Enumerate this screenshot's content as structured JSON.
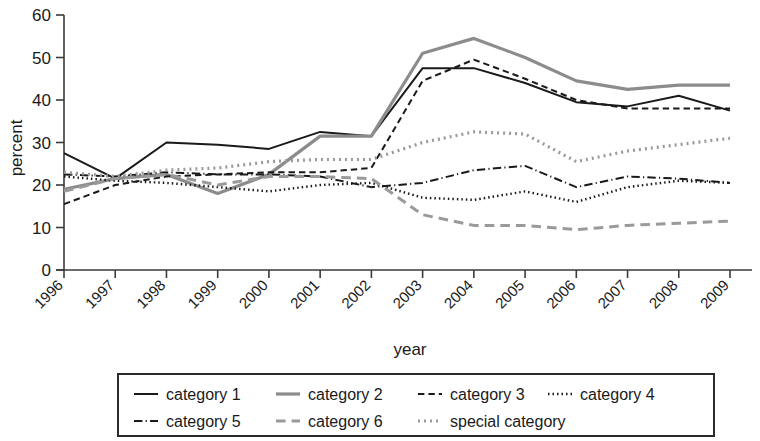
{
  "chart_data": {
    "type": "line",
    "title": "",
    "xlabel": "year",
    "ylabel": "percent",
    "xlim": [
      1996,
      2009
    ],
    "ylim": [
      0,
      60
    ],
    "yticks": [
      0,
      10,
      20,
      30,
      40,
      50,
      60
    ],
    "grid": false,
    "legend_position": "bottom",
    "categories": [
      1996,
      1997,
      1998,
      1999,
      2000,
      2001,
      2002,
      2003,
      2004,
      2005,
      2006,
      2007,
      2008,
      2009
    ],
    "tick_labels": [
      "1996",
      "1997",
      "1998",
      "1999",
      "2000",
      "2001",
      "2002",
      "2003",
      "2004",
      "2005",
      "2006",
      "2007",
      "2008",
      "2009"
    ],
    "series": [
      {
        "name": "category 1",
        "style": "solid",
        "color": "#1a1a1a",
        "width": 2.0,
        "values": [
          27.5,
          21.5,
          30.0,
          29.5,
          28.5,
          32.5,
          31.5,
          47.5,
          47.5,
          44.0,
          39.5,
          38.5,
          41.0,
          37.5
        ]
      },
      {
        "name": "category 2",
        "style": "solid",
        "color": "#8c8c8c",
        "width": 3.2,
        "values": [
          19.0,
          21.5,
          22.5,
          18.0,
          22.5,
          31.5,
          31.5,
          51.0,
          54.5,
          50.0,
          44.5,
          42.5,
          43.5,
          43.5
        ]
      },
      {
        "name": "category 3",
        "style": "dashed",
        "color": "#1a1a1a",
        "width": 2.0,
        "values": [
          15.5,
          20.0,
          22.0,
          22.5,
          23.0,
          23.0,
          24.0,
          44.5,
          49.5,
          45.0,
          40.0,
          38.0,
          38.0,
          38.0
        ]
      },
      {
        "name": "category 4",
        "style": "dotted",
        "color": "#1a1a1a",
        "width": 2.4,
        "values": [
          22.0,
          21.0,
          20.5,
          19.5,
          18.5,
          20.0,
          20.5,
          17.0,
          16.5,
          18.5,
          16.0,
          19.5,
          21.0,
          20.5
        ]
      },
      {
        "name": "category 5",
        "style": "dashdot",
        "color": "#1a1a1a",
        "width": 2.0,
        "values": [
          22.5,
          22.0,
          23.0,
          22.5,
          22.5,
          22.0,
          19.5,
          20.5,
          23.5,
          24.5,
          19.5,
          22.0,
          21.5,
          20.5
        ]
      },
      {
        "name": "category 6",
        "style": "dashed",
        "color": "#9a9a9a",
        "width": 3.0,
        "values": [
          18.5,
          21.5,
          22.5,
          20.0,
          22.0,
          22.0,
          21.5,
          13.0,
          10.5,
          10.5,
          9.5,
          10.5,
          11.0,
          11.5
        ]
      },
      {
        "name": "special category",
        "style": "dotted",
        "color": "#9a9a9a",
        "width": 3.2,
        "values": [
          23.0,
          22.0,
          23.5,
          24.0,
          25.5,
          26.0,
          26.0,
          30.0,
          32.5,
          32.0,
          25.5,
          28.0,
          29.5,
          31.0
        ]
      }
    ]
  },
  "axes": {
    "ylabel": "percent",
    "xlabel": "year",
    "ytick_labels": [
      "0",
      "10",
      "20",
      "30",
      "40",
      "50",
      "60"
    ]
  },
  "legend": {
    "items": [
      {
        "label": "category 1",
        "style": "solid",
        "color": "#1a1a1a"
      },
      {
        "label": "category 2",
        "style": "solid",
        "color": "#8c8c8c"
      },
      {
        "label": "category 3",
        "style": "dashed",
        "color": "#1a1a1a"
      },
      {
        "label": "category 4",
        "style": "dotted",
        "color": "#1a1a1a"
      },
      {
        "label": "category 5",
        "style": "dashdot",
        "color": "#1a1a1a"
      },
      {
        "label": "category 6",
        "style": "dashed",
        "color": "#9a9a9a"
      },
      {
        "label": "special category",
        "style": "dotted",
        "color": "#9a9a9a"
      }
    ]
  }
}
